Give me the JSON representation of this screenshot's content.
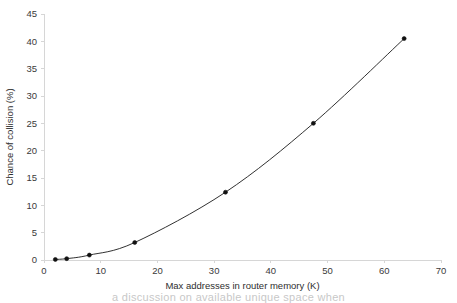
{
  "chart_data": {
    "type": "line",
    "title": "",
    "xlabel": "Max addresses in router memory (K)",
    "ylabel": "Chance of collision (%)",
    "xlim": [
      0,
      70
    ],
    "ylim": [
      0,
      45
    ],
    "xticks": [
      0,
      10,
      20,
      30,
      40,
      50,
      60,
      70
    ],
    "yticks": [
      0,
      5,
      10,
      15,
      20,
      25,
      30,
      35,
      40,
      45
    ],
    "xtick_labels": [
      "0",
      "10",
      "20",
      "30",
      "40",
      "50",
      "60",
      "70"
    ],
    "ytick_labels": [
      "0",
      "5",
      "10",
      "15",
      "20",
      "25",
      "30",
      "35",
      "40",
      "45"
    ],
    "grid": false,
    "legend": "none",
    "marker": "filled-circle",
    "line_color": "#1a1a1a",
    "marker_color": "#111111",
    "axis_color": "#d6d6d6",
    "text_color": "#333333",
    "series": [
      {
        "name": "Chance of collision",
        "x": [
          2,
          4,
          8,
          16,
          32,
          47.5,
          63.5
        ],
        "values": [
          0.1,
          0.25,
          0.9,
          3.2,
          12.4,
          25.0,
          40.5
        ]
      }
    ]
  },
  "caption": {
    "fragment": "a discussion on available unique space when"
  }
}
